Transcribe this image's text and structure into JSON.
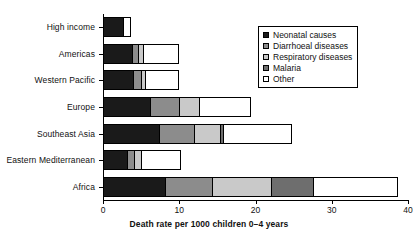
{
  "chart_data": {
    "type": "bar",
    "orientation": "horizontal",
    "stacked": true,
    "title": "",
    "xlabel": "Death rate per 1000 children 0–4 years",
    "ylabel": "",
    "xlim": [
      0,
      40
    ],
    "xticks": [
      0,
      10,
      20,
      30,
      40
    ],
    "xtick_labels": [
      "0",
      "10",
      "20",
      "30",
      "40"
    ],
    "grid": false,
    "legend_position": "top-right",
    "categories": [
      "High income",
      "Americas",
      "Western Pacific",
      "Eastern Mediterranean",
      "Europe",
      "Southeast Asia",
      "Africa"
    ],
    "category_order": [
      "High income",
      "Americas",
      "Western Pacific",
      "Europe",
      "Southeast Asia",
      "Eastern Mediterranean",
      "Africa"
    ],
    "series": [
      {
        "name": "Neonatal causes",
        "color": "#1a1a1a",
        "values": [
          2.6,
          3.8,
          3.9,
          3.2,
          6.2,
          7.3,
          8.1
        ]
      },
      {
        "name": "Diarrhoeal diseases",
        "color": "#8c8c8c",
        "values": [
          0.0,
          0.8,
          1.1,
          0.9,
          3.8,
          4.6,
          6.2
        ]
      },
      {
        "name": "Respiratory diseases",
        "color": "#c9c9c9",
        "values": [
          0.0,
          0.7,
          0.5,
          0.9,
          2.6,
          3.5,
          7.8
        ]
      },
      {
        "name": "Malaria",
        "color": "#6e6e6e",
        "values": [
          0.0,
          0.0,
          0.0,
          0.0,
          0.0,
          0.4,
          5.5
        ]
      },
      {
        "name": "Other",
        "color": "#ffffff",
        "values": [
          0.9,
          4.5,
          4.3,
          5.1,
          6.7,
          8.9,
          10.9
        ]
      }
    ],
    "totals": [
      3.5,
      9.8,
      9.8,
      10.1,
      19.3,
      24.7,
      38.5
    ]
  },
  "legend": {
    "items": [
      {
        "label": "Neonatal causes",
        "color": "#1a1a1a"
      },
      {
        "label": "Diarrhoeal diseases",
        "color": "#8c8c8c"
      },
      {
        "label": "Respiratory diseases",
        "color": "#c9c9c9"
      },
      {
        "label": "Malaria",
        "color": "#6e6e6e"
      },
      {
        "label": "Other",
        "color": "#ffffff"
      }
    ]
  }
}
